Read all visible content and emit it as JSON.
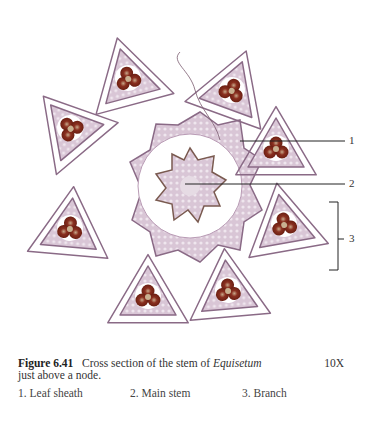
{
  "figure": {
    "number": "Figure 6.41",
    "caption_prefix": "Cross section of the stem of ",
    "caption_italic": "Equisetum",
    "caption_suffix": "just above a node.",
    "magnification": "10X",
    "labels": [
      {
        "num": "1",
        "text": "1. Leaf sheath"
      },
      {
        "num": "2",
        "text": "2. Main stem"
      },
      {
        "num": "3",
        "text": "3. Branch"
      }
    ]
  },
  "colors": {
    "tissue": "#c9b0c6",
    "tissue_outline": "#8a6a86",
    "vascular": "#7a2416",
    "background": "#ffffff"
  }
}
